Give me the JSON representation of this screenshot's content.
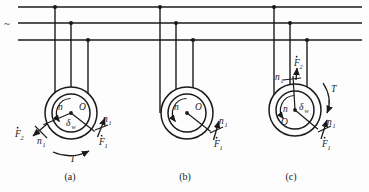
{
  "figure": {
    "background_color": "#fdfdfd",
    "line_color": "#1a1a1a",
    "supply_symbol": "~"
  },
  "bus": {
    "label": "~",
    "lines": [
      {
        "name": "phase-line-1",
        "y": 7
      },
      {
        "name": "phase-line-2",
        "y": 23
      },
      {
        "name": "phase-line-3",
        "y": 40
      }
    ],
    "x_start": 18,
    "x_end": 362
  },
  "panels": [
    {
      "id": "a",
      "caption": "(a)",
      "caption_x": 70,
      "caption_y": 180,
      "center": {
        "x": 71,
        "y": 113
      },
      "outer_radius": 26,
      "inner_radius": 19,
      "drops": [
        {
          "x": 55,
          "bus_y": 7
        },
        {
          "x": 71,
          "bus_y": 23
        },
        {
          "x": 88,
          "bus_y": 40
        }
      ],
      "labels": [
        {
          "name": "rotor-speed-n",
          "text": "n",
          "x": 58,
          "y": 110
        },
        {
          "name": "center-point-O",
          "text": "O",
          "x": 79,
          "y": 110
        },
        {
          "name": "angle-delta-w",
          "text": "δ",
          "sub": "w",
          "x": 66,
          "y": 126
        },
        {
          "name": "force-F2",
          "text": "F",
          "sub": "2",
          "dot": true,
          "x": 15,
          "y": 137
        },
        {
          "name": "speed-n1-left",
          "text": "n",
          "sub": "1",
          "x": 37,
          "y": 144
        },
        {
          "name": "speed-n1-right",
          "text": "n",
          "sub": "1",
          "x": 103,
          "y": 122
        },
        {
          "name": "force-F1",
          "text": "F",
          "sub": "1",
          "dot": true,
          "x": 99,
          "y": 145
        },
        {
          "name": "torque-T",
          "text": "T",
          "x": 70,
          "y": 162
        }
      ]
    },
    {
      "id": "b",
      "caption": "(b)",
      "caption_x": 185,
      "caption_y": 180,
      "center": {
        "x": 187,
        "y": 113
      },
      "outer_radius": 26,
      "inner_radius": 19,
      "drops": [
        {
          "x": 160,
          "bus_y": 7
        },
        {
          "x": 176,
          "bus_y": 23
        },
        {
          "x": 193,
          "bus_y": 40
        }
      ],
      "labels": [
        {
          "name": "rotor-speed-n",
          "text": "n",
          "x": 174,
          "y": 110
        },
        {
          "name": "center-point-O",
          "text": "O",
          "x": 195,
          "y": 110
        },
        {
          "name": "speed-n1-right",
          "text": "n",
          "sub": "1",
          "x": 219,
          "y": 124
        },
        {
          "name": "force-F1",
          "text": "F",
          "sub": "1",
          "dot": true,
          "x": 214,
          "y": 147
        }
      ]
    },
    {
      "id": "c",
      "caption": "(c)",
      "caption_x": 291,
      "caption_y": 180,
      "center": {
        "x": 295,
        "y": 110
      },
      "outer_radius": 26,
      "inner_radius": 19,
      "drops": [
        {
          "x": 274,
          "bus_y": 7
        },
        {
          "x": 290,
          "bus_y": 23
        },
        {
          "x": 307,
          "bus_y": 40
        }
      ],
      "labels": [
        {
          "name": "force-F2",
          "text": "F",
          "sub": "2",
          "dot": true,
          "x": 294,
          "y": 66
        },
        {
          "name": "speed-n1-top",
          "text": "n",
          "sub": "1",
          "x": 275,
          "y": 80
        },
        {
          "name": "rotor-speed-n",
          "text": "n",
          "x": 283,
          "y": 112
        },
        {
          "name": "angle-delta-w",
          "text": "δ",
          "sub": "w",
          "x": 299,
          "y": 110
        },
        {
          "name": "center-point-O",
          "text": "O",
          "x": 281,
          "y": 125
        },
        {
          "name": "torque-T",
          "text": "T",
          "x": 331,
          "y": 92
        },
        {
          "name": "speed-n1-right",
          "text": "n",
          "sub": "1",
          "x": 327,
          "y": 125
        },
        {
          "name": "force-F1",
          "text": "F",
          "sub": "1",
          "dot": true,
          "x": 322,
          "y": 147
        }
      ]
    }
  ]
}
